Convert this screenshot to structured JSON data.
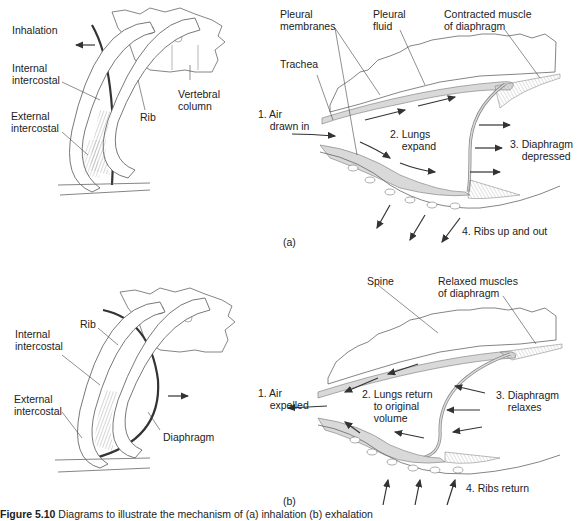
{
  "figure": {
    "caption_number": "Figure 5.10",
    "caption_text": " Diagrams to illustrate the mechanism of (a) inhalation (b) exhalation"
  },
  "panel_a": {
    "id_label": "(a)",
    "rib_cage": {
      "title": "Inhalation",
      "labels": {
        "internal_intercostal": "Internal\nintercostal",
        "external_intercostal": "External\nintercostal",
        "rib": "Rib",
        "vertebral_column": "Vertebral\ncolumn"
      },
      "arrow_direction": "left"
    },
    "lung": {
      "labels": {
        "pleural_membranes": "Pleural\nmembranes",
        "pleural_fluid": "Pleural\nfluid",
        "contracted_muscle": "Contracted muscle\nof diaphragm",
        "trachea": "Trachea"
      },
      "steps": [
        "1. Air\n    drawn in",
        "2. Lungs\n    expand",
        "3. Diaphragm\n    depressed",
        "4. Ribs up and out"
      ]
    }
  },
  "panel_b": {
    "id_label": "(b)",
    "rib_cage": {
      "labels": {
        "rib": "Rib",
        "internal_intercostal": "Internal\nintercostal",
        "external_intercostal": "External\nintercostal",
        "diaphragm": "Diaphragm"
      },
      "arrow_direction": "right"
    },
    "lung": {
      "labels": {
        "spine": "Spine",
        "relaxed_muscles": "Relaxed muscles\nof diaphragm"
      },
      "steps": [
        "1. Air\n    expelled",
        "2. Lungs return\n    to original\n    volume",
        "3. Diaphragm\n    relaxes",
        "4. Ribs return"
      ]
    }
  },
  "colors": {
    "line": "#333333",
    "pleura_fill": "#d9d9d9",
    "bone_fill": "#ffffff",
    "muscle_hatch": "#888888"
  }
}
